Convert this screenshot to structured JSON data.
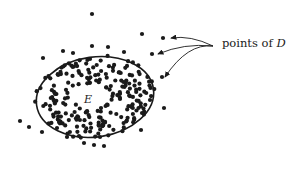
{
  "diagram": {
    "type": "point-set-with-ellipse",
    "labels": {
      "points_prefix": "points of ",
      "points_var": "D",
      "ellipse_label": "E"
    },
    "colors": {
      "ink": "#1a1a1a",
      "background": "#ffffff"
    },
    "ellipse": {
      "cx": 95,
      "cy": 97,
      "rx": 59,
      "ry": 40,
      "rotate": -8
    },
    "arrow_source": [
      213,
      46
    ],
    "arrow_targets": [
      [
        168,
        38
      ],
      [
        155,
        54
      ],
      [
        162,
        77
      ]
    ],
    "outlier_points": [
      [
        92,
        14
      ],
      [
        142,
        34
      ],
      [
        163,
        38
      ],
      [
        152,
        54
      ],
      [
        162,
        77
      ],
      [
        164,
        108
      ],
      [
        92,
        46
      ],
      [
        63,
        51
      ],
      [
        73,
        53
      ],
      [
        43,
        58
      ],
      [
        20,
        121
      ],
      [
        29,
        127
      ],
      [
        42,
        132
      ],
      [
        57,
        128
      ],
      [
        67,
        137
      ],
      [
        79,
        136
      ],
      [
        84,
        143
      ],
      [
        94,
        145
      ],
      [
        104,
        146
      ],
      [
        100,
        137
      ],
      [
        141,
        130
      ],
      [
        142,
        113
      ],
      [
        150,
        100
      ],
      [
        124,
        52
      ],
      [
        108,
        47
      ]
    ]
  }
}
